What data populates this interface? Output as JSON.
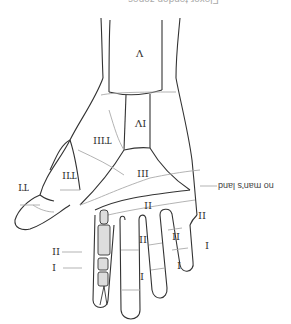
{
  "figure": {
    "title_cropped": "Flexor tendon zones",
    "orientation": "rotated 180 degrees",
    "callout": "no man's land",
    "zones": {
      "wrist": "V",
      "carpal_tunnel": "IV",
      "palm": "III",
      "thumb_thenar": "TIII",
      "thumb_proximal": "TII",
      "thumb_distal": "TI",
      "index_proximal": "II",
      "index_distal": "I",
      "middle_palm": "II",
      "middle_proximal": "II",
      "middle_distal": "I",
      "ring_proximal": "II",
      "ring_distal": "I",
      "little_proximal": "II",
      "little_distal": "I"
    },
    "colors": {
      "line": "#333333",
      "guide": "#aaaaaa",
      "background": "#ffffff"
    }
  }
}
